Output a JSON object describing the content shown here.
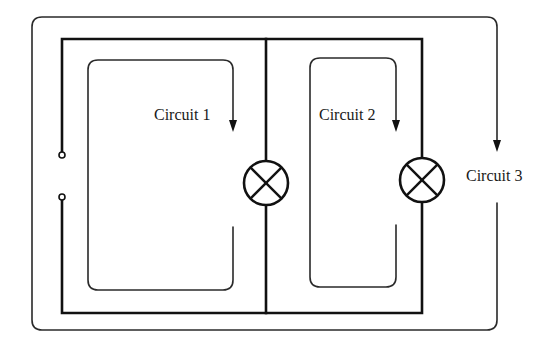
{
  "diagram": {
    "type": "parallel-circuit",
    "colors": {
      "line": "#111111",
      "background": "#ffffff",
      "text": "#1a1a1a"
    },
    "labels": {
      "circuit1": "Circuit 1",
      "circuit2": "Circuit 2",
      "circuit3": "Circuit 3"
    },
    "components": [
      {
        "kind": "switch-open",
        "icon": "open-switch-terminals"
      },
      {
        "kind": "lamp",
        "icon": "lamp-cross-circle",
        "branch": 1
      },
      {
        "kind": "lamp",
        "icon": "lamp-cross-circle",
        "branch": 2
      }
    ],
    "current_paths": [
      {
        "label": "Circuit 1",
        "direction": "clockwise-down-arrow"
      },
      {
        "label": "Circuit 2",
        "direction": "clockwise-down-arrow"
      },
      {
        "label": "Circuit 3",
        "direction": "clockwise-down-arrow"
      }
    ]
  }
}
